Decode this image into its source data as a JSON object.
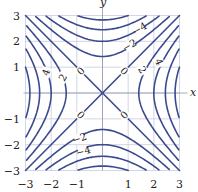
{
  "chart_data": {
    "type": "contour",
    "title": "",
    "function": "x^2 - y^2",
    "xlabel": "x",
    "ylabel": "y",
    "xlim": [
      -3,
      3
    ],
    "ylim": [
      -3,
      3
    ],
    "grid": true,
    "xticks": [
      -3,
      -2,
      -1,
      1,
      2,
      3
    ],
    "yticks": [
      -3,
      -2,
      -1,
      1,
      2,
      3
    ],
    "xtick_labels": [
      "−3",
      "−2",
      "−1",
      "1",
      "2",
      "3"
    ],
    "ytick_labels": [
      "−3",
      "−2",
      "−1",
      "1",
      "2",
      "3"
    ],
    "levels": [
      -8,
      -6,
      -4,
      -2,
      0,
      2,
      4,
      6,
      8
    ],
    "line_color": "#3b4a8c",
    "grid_color": "#c8cce0",
    "contour_labels": [
      {
        "text": "0",
        "x": -0.85,
        "y": 0.85,
        "angle": -45
      },
      {
        "text": "0",
        "x": 0.85,
        "y": 0.85,
        "angle": 45
      },
      {
        "text": "0",
        "x": -0.85,
        "y": -0.85,
        "angle": 45
      },
      {
        "text": "0",
        "x": 0.85,
        "y": -0.85,
        "angle": -45
      },
      {
        "text": "4",
        "x": -2.2,
        "y": 0.8,
        "angle": -70
      },
      {
        "text": "2",
        "x": -1.55,
        "y": 0.6,
        "angle": -60
      },
      {
        "text": "2",
        "x": 1.55,
        "y": 0.9,
        "angle": 60
      },
      {
        "text": "4",
        "x": 2.2,
        "y": 1.2,
        "angle": 65
      },
      {
        "text": "−4",
        "x": 1.45,
        "y": 2.5,
        "angle": -30
      },
      {
        "text": "−2",
        "x": 1.05,
        "y": 1.85,
        "angle": -30
      },
      {
        "text": "−2",
        "x": -0.9,
        "y": -1.75,
        "angle": -20
      },
      {
        "text": "−4",
        "x": -0.75,
        "y": -2.25,
        "angle": -15
      }
    ]
  }
}
